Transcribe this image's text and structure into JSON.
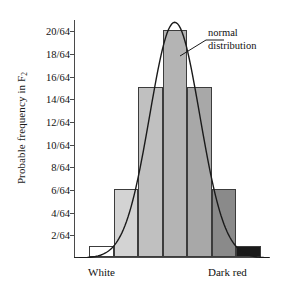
{
  "chart_data": {
    "type": "bar",
    "title": "",
    "subtitle": "",
    "xlabel": "",
    "ylabel": "Probable frequency in F",
    "ylabel_subscript": "2",
    "categories": [
      "White",
      "",
      "",
      "",
      "",
      "",
      "Dark red"
    ],
    "values": [
      1,
      6,
      15,
      20,
      15,
      6,
      1
    ],
    "value_labels": [
      "1/64",
      "6/64",
      "15/64",
      "20/64",
      "15/64",
      "6/64",
      "1/64"
    ],
    "bar_colors": [
      "#ffffff",
      "#d3d3d3",
      "#c0c0c0",
      "#b4b4b4",
      "#a8a8a8",
      "#8a8a8a",
      "#1a1a1a"
    ],
    "bar_edge_color": "#3c3c3c",
    "ylim": [
      0,
      21
    ],
    "ytick_values": [
      2,
      4,
      6,
      8,
      10,
      12,
      14,
      16,
      18,
      20
    ],
    "ytick_labels": [
      "2/64",
      "4/64",
      "6/64",
      "8/64",
      "10/64",
      "12/64",
      "14/64",
      "16/64",
      "18/64",
      "20/64"
    ],
    "grid": false,
    "legend": "none",
    "axis_color": "#4a4a4a",
    "curve": {
      "name": "normal distribution",
      "color": "#1a1a1a",
      "mean_bin": 3,
      "peak_value": 20.8,
      "sigma_bins": 1.02
    },
    "annotations": [
      {
        "text_line1": "normal",
        "text_line2": "distribution",
        "points_to": "curve"
      }
    ],
    "xtick_labels": {
      "left": "White",
      "right": "Dark red"
    }
  }
}
